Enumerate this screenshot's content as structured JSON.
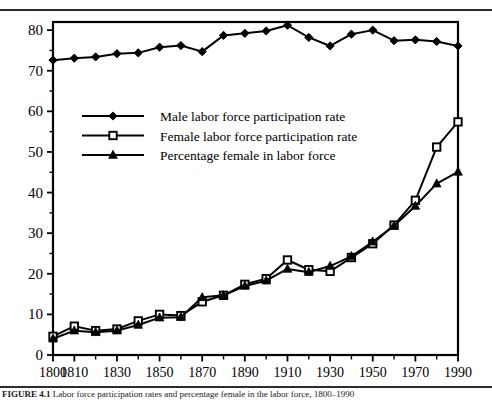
{
  "figure": {
    "caption_prefix": "FIGURE 4.1",
    "caption_text": "Labor force participation rates and percentage female in the labor force, 1800–1990"
  },
  "chart_data": {
    "type": "line",
    "title": "",
    "xlabel": "",
    "ylabel": "",
    "xlim": [
      1800,
      1990
    ],
    "ylim": [
      0,
      82
    ],
    "y_ticks": [
      0,
      10,
      20,
      30,
      40,
      50,
      60,
      70,
      80
    ],
    "y_minor_ticks": [
      5,
      15,
      25,
      35,
      45,
      55,
      65,
      75
    ],
    "x_ticks": [
      1800,
      1810,
      1820,
      1830,
      1840,
      1850,
      1860,
      1870,
      1880,
      1890,
      1900,
      1910,
      1920,
      1930,
      1940,
      1950,
      1960,
      1970,
      1980,
      1990
    ],
    "x_tick_labels": [
      "1800",
      "1810",
      "",
      "1830",
      "",
      "1850",
      "",
      "1870",
      "",
      "1890",
      "",
      "1910",
      "",
      "1930",
      "",
      "1950",
      "",
      "1970",
      "",
      "1990"
    ],
    "grid": false,
    "legend_position": "upper-left-inside",
    "x": [
      1800,
      1810,
      1820,
      1830,
      1840,
      1850,
      1860,
      1870,
      1880,
      1890,
      1900,
      1910,
      1920,
      1930,
      1940,
      1950,
      1960,
      1970,
      1980,
      1990
    ],
    "series": [
      {
        "name": "Male labor force participation rate",
        "marker": "filled-diamond",
        "values": [
          72.6,
          73.1,
          73.4,
          74.2,
          74.4,
          75.8,
          76.2,
          74.7,
          78.7,
          79.2,
          79.8,
          81.2,
          78.2,
          76.1,
          79.0,
          80.0,
          77.4,
          77.6,
          77.2,
          76.1
        ]
      },
      {
        "name": "Female labor force participation rate",
        "marker": "open-square",
        "values": [
          4.6,
          7.1,
          6.0,
          6.4,
          8.4,
          10.0,
          9.7,
          13.1,
          14.7,
          17.4,
          18.8,
          23.4,
          21.0,
          20.6,
          24.0,
          27.4,
          32.0,
          38.1,
          51.2,
          57.4
        ]
      },
      {
        "name": "Percentage female in labor force",
        "marker": "filled-triangle",
        "values": [
          4.0,
          6.0,
          5.6,
          6.0,
          7.4,
          9.2,
          9.3,
          14.2,
          14.7,
          17.0,
          18.3,
          21.2,
          20.4,
          21.9,
          24.3,
          27.9,
          31.8,
          36.7,
          42.2,
          45.1
        ]
      }
    ]
  },
  "legend": {
    "items": [
      {
        "label": "Male labor force participation rate",
        "marker": "filled-diamond"
      },
      {
        "label": "Female labor force participation rate",
        "marker": "open-square"
      },
      {
        "label": "Percentage female in labor force",
        "marker": "filled-triangle"
      }
    ]
  },
  "colors": {
    "line": "#000000",
    "axis": "#000000",
    "background": "#ffffff",
    "rule": "#2c2c2c"
  }
}
